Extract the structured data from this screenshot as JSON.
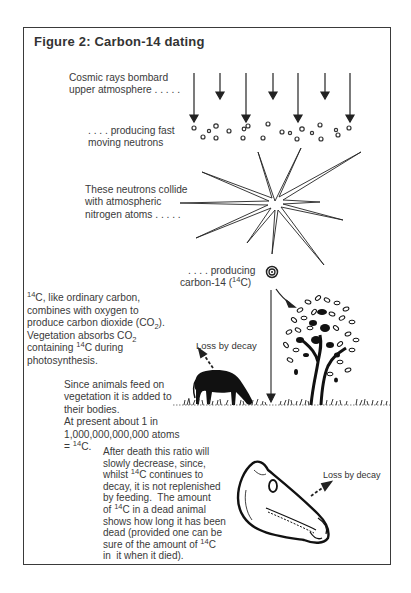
{
  "figure": {
    "title": "Figure 2:  Carbon-14 dating"
  },
  "steps": {
    "cosmic_rays": [
      "Cosmic rays bombard",
      "upper atmosphere . . . . ."
    ],
    "neutrons": [
      ". . . . producing fast",
      "moving neutrons"
    ],
    "collision": [
      "These neutrons collide",
      "with atmospheric",
      "nitrogen atoms . . . . ."
    ],
    "carbon14": {
      "line1": ". . . . producing",
      "line2_prefix": "carbon-14 (",
      "isotope_mass": "14",
      "element": "C",
      "line2_suffix": ")"
    },
    "co2": {
      "l1_mass": "14",
      "l1_text": "C, like ordinary carbon,",
      "l2": "combines with oxygen to",
      "l3_text": "produce carbon dioxide (CO",
      "l3_sub": "2",
      "l3_end": ").",
      "l4_text": "Vegetation absorbs CO",
      "l4_sub": "2",
      "l5_pre": "containing ",
      "l5_mass": "14",
      "l5_post": "C during",
      "l6": "photosynthesis."
    },
    "animals": {
      "l1": "Since animals feed on",
      "l2": "vegetation it is added to",
      "l3": "their bodies.",
      "l4": "At present about 1 in",
      "l5": "1,000,000,000,000 atoms",
      "l6_pre": "= ",
      "l6_mass": "14",
      "l6_post": "C."
    },
    "death": {
      "l1": "After death this ratio will",
      "l2": "slowly decrease, since,",
      "l3_pre": "whilst ",
      "l3_mass": "14",
      "l3_post": "C continues to",
      "l4": "decay, it is not replenished",
      "l5": "by feeding.  The amount",
      "l6_pre": "of ",
      "l6_mass": "14",
      "l6_post": "C in a dead animal",
      "l7": "shows how long it has been",
      "l8": "dead (provided one can be",
      "l9_pre": "sure of the amount of ",
      "l9_mass": "14",
      "l9_post": "C",
      "l10": "in  it when it died)."
    }
  },
  "labels": {
    "loss_living": "Loss by decay",
    "loss_dead": "Loss by decay"
  },
  "illustrations": {
    "cosmic_ray_arrows": 7,
    "neutron_count": 21,
    "icons": [
      "cosmic-ray-arrow",
      "neutron-dot",
      "collision-starburst",
      "carbon14-atom",
      "tree",
      "grazing-horse",
      "horse-skull",
      "grass"
    ]
  },
  "colors": {
    "ink": "#222222",
    "text": "#3a3a3a",
    "frame": "#3a3a3a",
    "background": "#ffffff"
  }
}
